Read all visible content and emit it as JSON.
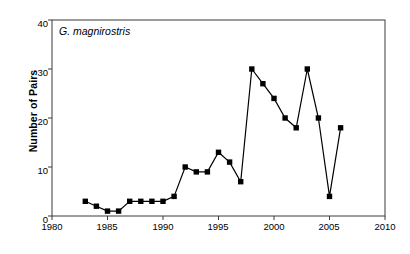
{
  "chart_data": {
    "type": "line",
    "title": "",
    "annotation": "G. magnirostris",
    "xlabel": "",
    "ylabel": "Number of Pairs",
    "xlim": [
      1980,
      2010
    ],
    "ylim": [
      0,
      40
    ],
    "xticks": [
      1980,
      1985,
      1990,
      1995,
      2000,
      2005,
      2010
    ],
    "yticks": [
      0,
      10,
      20,
      30,
      40
    ],
    "grid": false,
    "legend": false,
    "marker": "square",
    "marker_color": "#000000",
    "line_color": "#000000",
    "x": [
      1983,
      1984,
      1985,
      1986,
      1987,
      1988,
      1989,
      1990,
      1991,
      1992,
      1993,
      1994,
      1995,
      1996,
      1997,
      1998,
      1999,
      2000,
      2001,
      2002,
      2003,
      2004,
      2005,
      2006
    ],
    "values": [
      3,
      2,
      1,
      1,
      3,
      3,
      3,
      3,
      4,
      10,
      9,
      9,
      13,
      11,
      7,
      30,
      27,
      24,
      20,
      18,
      30,
      20,
      4,
      18
    ],
    "series": [
      {
        "name": "G. magnirostris",
        "points": [
          {
            "year": 1983,
            "pairs": 3
          },
          {
            "year": 1984,
            "pairs": 2
          },
          {
            "year": 1985,
            "pairs": 1
          },
          {
            "year": 1986,
            "pairs": 1
          },
          {
            "year": 1987,
            "pairs": 3
          },
          {
            "year": 1988,
            "pairs": 3
          },
          {
            "year": 1989,
            "pairs": 3
          },
          {
            "year": 1990,
            "pairs": 3
          },
          {
            "year": 1991,
            "pairs": 4
          },
          {
            "year": 1992,
            "pairs": 10
          },
          {
            "year": 1993,
            "pairs": 9
          },
          {
            "year": 1994,
            "pairs": 9
          },
          {
            "year": 1995,
            "pairs": 13
          },
          {
            "year": 1996,
            "pairs": 11
          },
          {
            "year": 1997,
            "pairs": 7
          },
          {
            "year": 1998,
            "pairs": 30
          },
          {
            "year": 1999,
            "pairs": 27
          },
          {
            "year": 2000,
            "pairs": 24
          },
          {
            "year": 2001,
            "pairs": 20
          },
          {
            "year": 2002,
            "pairs": 18
          },
          {
            "year": 2003,
            "pairs": 30
          },
          {
            "year": 2004,
            "pairs": 20
          },
          {
            "year": 2005,
            "pairs": 4
          },
          {
            "year": 2006,
            "pairs": 18
          }
        ]
      }
    ]
  },
  "axis": {
    "y_tick_labels": [
      "0",
      "10",
      "20",
      "30",
      "40"
    ],
    "x_tick_labels": [
      "1980",
      "1985",
      "1990",
      "1995",
      "2000",
      "2005",
      "2010"
    ],
    "y_axis_title": "Number of Pairs"
  },
  "colors": {
    "ink": "#000000",
    "frame": "#3a3a3a",
    "background": "#ffffff"
  }
}
